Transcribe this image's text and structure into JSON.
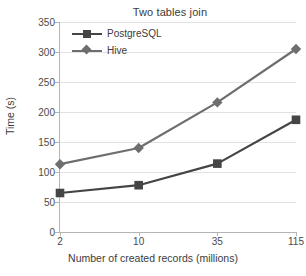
{
  "chart_data": {
    "type": "line",
    "title": "Two tables join",
    "xlabel": "Number of created records (millions)",
    "ylabel": "Time (s)",
    "categories": [
      "2",
      "10",
      "35",
      "115"
    ],
    "yticks": [
      "0",
      "50",
      "100",
      "150",
      "200",
      "250",
      "300",
      "350"
    ],
    "ylim": [
      0,
      350
    ],
    "grid": "horizontal",
    "legend_position": "top-left-inside",
    "series": [
      {
        "name": "PostgreSQL",
        "values": [
          65,
          78,
          114,
          187
        ],
        "color": "#454545",
        "marker": "square"
      },
      {
        "name": "Hive",
        "values": [
          113,
          140,
          216,
          305
        ],
        "color": "#6e6e6e",
        "marker": "diamond"
      }
    ]
  },
  "colors": {
    "axis": "#b4b4b4",
    "grid": "#e2e2e2",
    "text": "#3c3c3c",
    "background": "#ffffff"
  }
}
